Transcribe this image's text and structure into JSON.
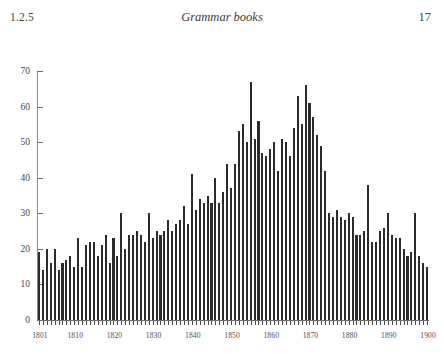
{
  "header": {
    "section_number": "1.2.5",
    "running_title": "Grammar books",
    "page_number": "17"
  },
  "chart_data": {
    "type": "bar",
    "title": "",
    "subtitle": "",
    "xlabel": "",
    "ylabel": "",
    "grid": false,
    "legend": "none",
    "xlim": [
      1800.5,
      1900.5
    ],
    "ylim": [
      0,
      70
    ],
    "ytick_labels": [
      "0",
      "10",
      "20",
      "30",
      "40",
      "50",
      "60",
      "70"
    ],
    "ytick_values": [
      0,
      10,
      20,
      30,
      40,
      50,
      60,
      70
    ],
    "xtick_labels": [
      "1801",
      "1810",
      "1820",
      "1830",
      "1840",
      "1850",
      "1860",
      "1870",
      "1880",
      "1890",
      "1900"
    ],
    "xtick_values": [
      1801,
      1810,
      1820,
      1830,
      1840,
      1850,
      1860,
      1870,
      1880,
      1890,
      1900
    ],
    "bar_color": "#2b2b2b",
    "background_color": "#ffffff",
    "axis_color": "#6e6e6e",
    "categories": [
      1801,
      1802,
      1803,
      1804,
      1805,
      1806,
      1807,
      1808,
      1809,
      1810,
      1811,
      1812,
      1813,
      1814,
      1815,
      1816,
      1817,
      1818,
      1819,
      1820,
      1821,
      1822,
      1823,
      1824,
      1825,
      1826,
      1827,
      1828,
      1829,
      1830,
      1831,
      1832,
      1833,
      1834,
      1835,
      1836,
      1837,
      1838,
      1839,
      1840,
      1841,
      1842,
      1843,
      1844,
      1845,
      1846,
      1847,
      1848,
      1849,
      1850,
      1851,
      1852,
      1853,
      1854,
      1855,
      1856,
      1857,
      1858,
      1859,
      1860,
      1861,
      1862,
      1863,
      1864,
      1865,
      1866,
      1867,
      1868,
      1869,
      1870,
      1871,
      1872,
      1873,
      1874,
      1875,
      1876,
      1877,
      1878,
      1879,
      1880,
      1881,
      1882,
      1883,
      1884,
      1885,
      1886,
      1887,
      1888,
      1889,
      1890,
      1891,
      1892,
      1893,
      1894,
      1895,
      1896,
      1897,
      1898,
      1899,
      1900
    ],
    "values": [
      19,
      14,
      20,
      16,
      20,
      14,
      16,
      17,
      18,
      15,
      23,
      15,
      21,
      22,
      22,
      18,
      21,
      24,
      16,
      23,
      18,
      30,
      20,
      24,
      24,
      25,
      24,
      22,
      30,
      23,
      25,
      24,
      25,
      28,
      25,
      27,
      28,
      32,
      27,
      41,
      31,
      34,
      33,
      35,
      33,
      40,
      33,
      36,
      44,
      37,
      44,
      53,
      55,
      50,
      67,
      51,
      56,
      47,
      46,
      48,
      50,
      42,
      51,
      50,
      46,
      54,
      63,
      55,
      66,
      61,
      57,
      52,
      49,
      42,
      30,
      29,
      31,
      29,
      28,
      30,
      29,
      24,
      24,
      25,
      38,
      22,
      22,
      25,
      26,
      30,
      24,
      23,
      23,
      20,
      18,
      19,
      30,
      18,
      16,
      15
    ]
  }
}
